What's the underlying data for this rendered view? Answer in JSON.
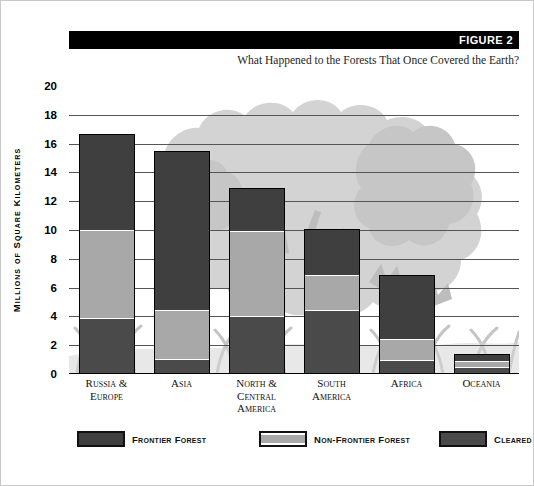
{
  "header": {
    "figure_label": "FIGURE 2",
    "subtitle": "What  Happened to the Forests That Once Covered  the Earth?"
  },
  "colors": {
    "frontier": "#3f3f3f",
    "non_frontier": "#a8a8a8",
    "cleared": "#4a4a4a",
    "banner": "#000000",
    "gridline": "#555555",
    "background_art": "#cfcfcf"
  },
  "legend": {
    "items": [
      {
        "label": "Frontier Forest",
        "color": "#3f3f3f"
      },
      {
        "label": "Non-Frontier Forest",
        "color": "#a8a8a8"
      },
      {
        "label": "Cleared",
        "color": "#4a4a4a"
      }
    ]
  },
  "axis": {
    "y_title": "Millions of Square Kilometers",
    "y_ticks": [
      "0",
      "2",
      "4",
      "6",
      "8",
      "10",
      "12",
      "14",
      "16",
      "18",
      "20"
    ]
  },
  "chart_data": {
    "type": "bar",
    "title": "What  Happened to the Forests That Once Covered  the Earth?",
    "subtitle": "FIGURE 2",
    "stacked": true,
    "xlabel": "",
    "ylabel": "Millions of Square Kilometers",
    "ylim": [
      0,
      20
    ],
    "ytick_step": 2,
    "grid": true,
    "legend_position": "bottom",
    "categories": [
      "Russia & Europe",
      "Asia",
      "North & Central America",
      "South America",
      "Africa",
      "Oceania"
    ],
    "category_lines": [
      [
        "Russia &",
        "Europe"
      ],
      [
        "Asia"
      ],
      [
        "North &",
        "Central America"
      ],
      [
        "South",
        "America"
      ],
      [
        "Africa"
      ],
      [
        "Oceania"
      ]
    ],
    "series": [
      {
        "name": "Cleared",
        "values": [
          3.8,
          0.9,
          3.9,
          4.4,
          0.85,
          0.4
        ]
      },
      {
        "name": "Non-Frontier Forest",
        "values": [
          6.2,
          3.5,
          6.1,
          2.5,
          1.55,
          0.5
        ]
      },
      {
        "name": "Frontier Forest",
        "values": [
          6.7,
          11.1,
          2.9,
          3.2,
          4.5,
          0.5
        ]
      }
    ],
    "totals": [
      16.7,
      15.5,
      12.9,
      10.1,
      6.9,
      1.4
    ]
  }
}
